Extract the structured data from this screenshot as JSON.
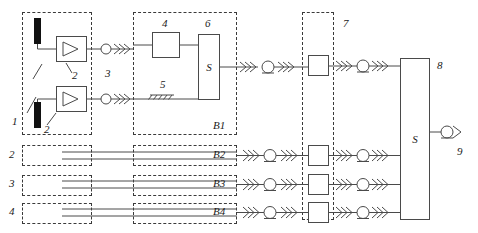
{
  "diagram": {
    "stroke_color": "#4a4a4a",
    "text_color": "#1a1a1a",
    "sensor_color": "#111111"
  },
  "labels": {
    "n1": "1",
    "n2a": "2",
    "n2b": "2",
    "n3": "3",
    "n4": "4",
    "n5": "5",
    "n6": "6",
    "n7": "7",
    "n8": "8",
    "n9": "9",
    "ch2": "2",
    "ch3": "3",
    "ch4": "4"
  },
  "blocks": {
    "converter4": "",
    "summing6": "S",
    "summing8": "S",
    "unit7": "",
    "unit7_b2": "",
    "unit7_b3": "",
    "unit7_b4": ""
  },
  "channels": [
    {
      "tag": "B1",
      "label": "B1"
    },
    {
      "tag": "B2",
      "label": "B2"
    },
    {
      "tag": "B3",
      "label": "B3"
    },
    {
      "tag": "B4",
      "label": "B4"
    }
  ]
}
